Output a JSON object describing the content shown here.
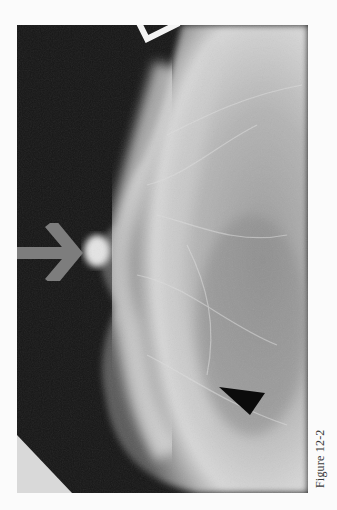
{
  "figure": {
    "caption": "Figure 12-2",
    "image_type": "mammogram",
    "markers": [
      {
        "type": "arrow",
        "color": "#7a7a7a",
        "direction": "right",
        "points_to": "nipple"
      },
      {
        "type": "arrowhead",
        "color": "#0a0a0a",
        "direction": "left"
      },
      {
        "type": "open-chevron",
        "color": "#f5f5f5",
        "position": "top"
      }
    ]
  }
}
